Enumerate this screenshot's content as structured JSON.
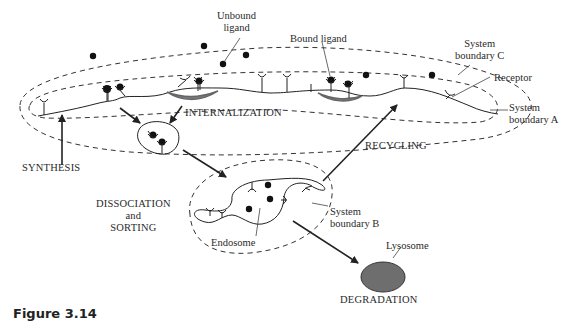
{
  "figure": {
    "caption": "Figure 3.14",
    "colors": {
      "line": "#222222",
      "dash": "#333333",
      "coated_pit": "#777777",
      "lysosome": "#6e6e6e",
      "ligand": "#111111",
      "background": "#ffffff"
    }
  },
  "labels": {
    "unbound_ligand": [
      "Unbound",
      "ligand"
    ],
    "bound_ligand": "Bound ligand",
    "system_boundary_c": [
      "System",
      "boundary C"
    ],
    "receptor": "Receptor",
    "system_boundary_a": [
      "System",
      "boundary A"
    ],
    "internalization": "INTERNALIZATION",
    "recycling": "RECYCLING",
    "synthesis": "SYNTHESIS",
    "dissociation": [
      "DISSOCIATION",
      "and",
      "SORTING"
    ],
    "system_boundary_b": [
      "System",
      "boundary B"
    ],
    "endosome": "Endosome",
    "lysosome": "Lysosome",
    "degradation": "DEGRADATION"
  }
}
